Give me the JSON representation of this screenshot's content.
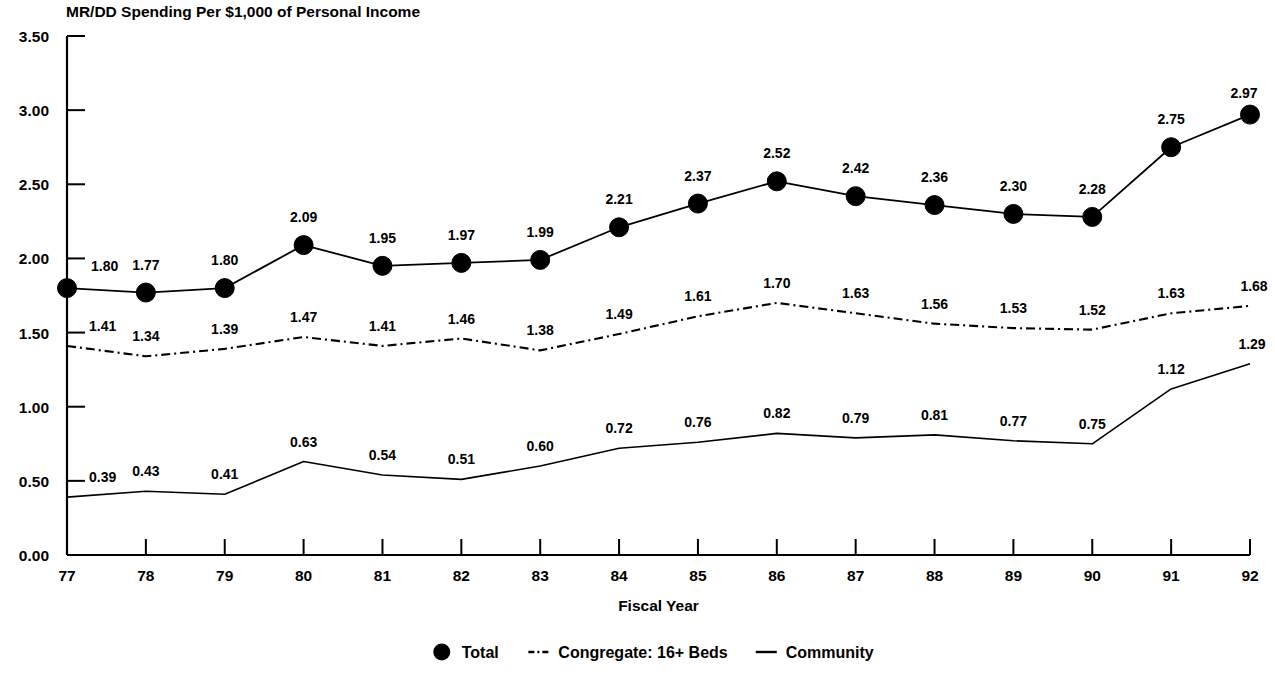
{
  "chart_data": {
    "type": "line",
    "title": "MR/DD Spending Per $1,000 of Personal Income",
    "xlabel": "Fiscal Year",
    "ylabel": "",
    "categories": [
      "77",
      "78",
      "79",
      "80",
      "81",
      "82",
      "83",
      "84",
      "85",
      "86",
      "87",
      "88",
      "89",
      "90",
      "91",
      "92"
    ],
    "x": [
      77,
      78,
      79,
      80,
      81,
      82,
      83,
      84,
      85,
      86,
      87,
      88,
      89,
      90,
      91,
      92
    ],
    "ylim": [
      0.0,
      3.5
    ],
    "ytick_labels": [
      "0.00",
      "0.50",
      "1.00",
      "1.50",
      "2.00",
      "2.50",
      "3.00",
      "3.50"
    ],
    "ytick_values": [
      0.0,
      0.5,
      1.0,
      1.5,
      2.0,
      2.5,
      3.0,
      3.5
    ],
    "grid": false,
    "legend_position": "bottom",
    "series": [
      {
        "name": "Total",
        "marker": "filled-circle",
        "line_style": "solid",
        "color": "#000000",
        "values": [
          1.8,
          1.77,
          1.8,
          2.09,
          1.95,
          1.97,
          1.99,
          2.21,
          2.37,
          2.52,
          2.42,
          2.36,
          2.3,
          2.28,
          2.75,
          2.97
        ],
        "labels": [
          "1.80",
          "1.77",
          "1.80",
          "2.09",
          "1.95",
          "1.97",
          "1.99",
          "2.21",
          "2.37",
          "2.52",
          "2.42",
          "2.36",
          "2.30",
          "2.28",
          "2.75",
          "2.97"
        ]
      },
      {
        "name": "Congregate: 16+ Beds",
        "marker": "none",
        "line_style": "dash-dot",
        "color": "#000000",
        "values": [
          1.41,
          1.34,
          1.39,
          1.47,
          1.41,
          1.46,
          1.38,
          1.49,
          1.61,
          1.7,
          1.63,
          1.56,
          1.53,
          1.52,
          1.63,
          1.68
        ],
        "labels": [
          "1.41",
          "1.34",
          "1.39",
          "1.47",
          "1.41",
          "1.46",
          "1.38",
          "1.49",
          "1.61",
          "1.70",
          "1.63",
          "1.56",
          "1.53",
          "1.52",
          "1.63",
          "1.68"
        ]
      },
      {
        "name": "Community",
        "marker": "none",
        "line_style": "solid-thin",
        "color": "#000000",
        "values": [
          0.39,
          0.43,
          0.41,
          0.63,
          0.54,
          0.51,
          0.6,
          0.72,
          0.76,
          0.82,
          0.79,
          0.81,
          0.77,
          0.75,
          1.12,
          1.29
        ],
        "labels": [
          "0.39",
          "0.43",
          "0.41",
          "0.63",
          "0.54",
          "0.51",
          "0.60",
          "0.72",
          "0.76",
          "0.82",
          "0.79",
          "0.81",
          "0.77",
          "0.75",
          "1.12",
          "1.29"
        ]
      }
    ]
  },
  "legend": {
    "items": [
      {
        "label": "Total",
        "glyph": "filled-circle-icon"
      },
      {
        "label": "Congregate: 16+ Beds",
        "glyph": "dash-dot-line-icon"
      },
      {
        "label": "Community",
        "glyph": "solid-line-icon"
      }
    ]
  }
}
